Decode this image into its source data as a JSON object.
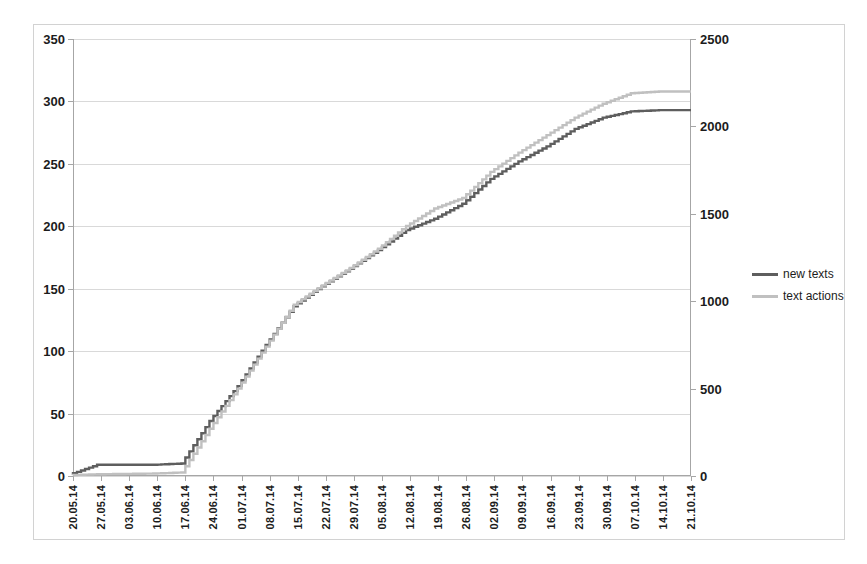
{
  "chart_data": {
    "type": "line",
    "title": "",
    "subtitle": "",
    "xlabel": "",
    "ylabel": "",
    "grid": true,
    "legend_position": "right",
    "axes": {
      "left": {
        "ticks": [
          0,
          50,
          100,
          150,
          200,
          250,
          300,
          350
        ],
        "ylim": [
          0,
          350
        ],
        "series": "new texts"
      },
      "right": {
        "ticks": [
          0,
          500,
          1000,
          1500,
          2000,
          2500
        ],
        "ylim": [
          0,
          2500
        ],
        "series": "text actions"
      }
    },
    "categories": [
      "20.05.14",
      "27.05.14",
      "03.06.14",
      "10.06.14",
      "17.06.14",
      "24.06.14",
      "01.07.14",
      "08.07.14",
      "15.07.14",
      "22.07.14",
      "29.07.14",
      "05.08.14",
      "12.08.14",
      "19.08.14",
      "26.08.14",
      "02.09.14",
      "09.09.14",
      "16.09.14",
      "23.09.14",
      "30.09.14",
      "07.10.14",
      "14.10.14",
      "21.10.14"
    ],
    "series": [
      {
        "name": "new texts",
        "axis": "left",
        "color": "#5e5e5e",
        "values": [
          1,
          9,
          9,
          9,
          10,
          44,
          72,
          105,
          136,
          152,
          166,
          181,
          197,
          206,
          218,
          238,
          252,
          264,
          278,
          287,
          292,
          293,
          293
        ]
      },
      {
        "name": "text actions",
        "axis": "right",
        "color": "#c0c0c0",
        "values": [
          5,
          10,
          12,
          14,
          20,
          270,
          500,
          740,
          980,
          1090,
          1190,
          1300,
          1430,
          1530,
          1590,
          1740,
          1850,
          1950,
          2050,
          2130,
          2190,
          2200,
          2200
        ]
      }
    ],
    "annotations": []
  },
  "legend": {
    "items": [
      {
        "label": "new texts",
        "color": "#5e5e5e"
      },
      {
        "label": "text actions",
        "color": "#c0c0c0"
      }
    ]
  }
}
